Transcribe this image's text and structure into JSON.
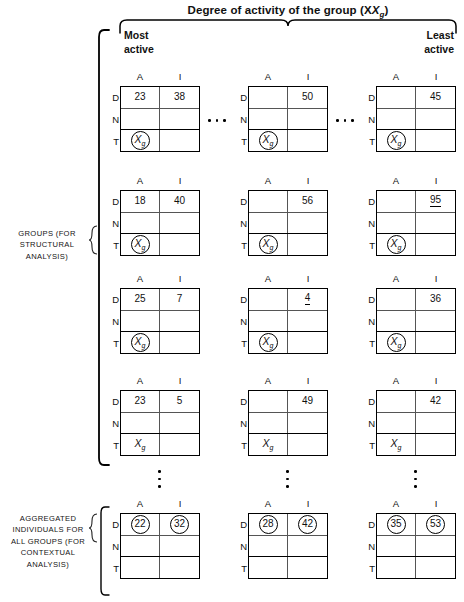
{
  "figure": {
    "title_main": "Degree of activity of the group",
    "title_var": "(X",
    "title_sub": "g",
    "title_close": ")",
    "corner_labels": {
      "most_active": "Most\nactive",
      "least_active": "Least\nactive"
    },
    "side_labels": {
      "groups": "GROUPS (FOR STRUCTURAL ANALYSIS)",
      "aggregated": "AGGREGATED INDIVIDUALS FOR ALL GROUPS (FOR CONTEXTUAL ANALYSIS)"
    },
    "column_headers": [
      "A",
      "I"
    ],
    "row_headers": [
      "D",
      "N",
      "T"
    ],
    "xg_symbol": "X",
    "xg_subscript": "g"
  },
  "chart_data": {
    "type": "table",
    "xlabel": "Degree of activity of the group (Xg) — Most active to Least active",
    "ylabel": "Groups (for structural analysis) / Aggregated individuals for all groups (for contextual analysis)",
    "columns": [
      "A",
      "I"
    ],
    "rows": [
      "D",
      "N",
      "T"
    ],
    "matrix_grid": [
      {
        "band": "groups",
        "row_index": 0,
        "matrices": [
          {
            "col": 0,
            "cells": {
              "D_A": "23",
              "D_I": "38",
              "N_A": "",
              "N_I": "",
              "T_A": "Xg",
              "T_I": ""
            },
            "t_a_circled": true,
            "underlined": []
          },
          {
            "col": 1,
            "cells": {
              "D_A": "",
              "D_I": "50",
              "N_A": "",
              "N_I": "",
              "T_A": "Xg",
              "T_I": ""
            },
            "t_a_circled": true,
            "underlined": []
          },
          {
            "col": 2,
            "cells": {
              "D_A": "",
              "D_I": "45",
              "N_A": "",
              "N_I": "",
              "T_A": "Xg",
              "T_I": ""
            },
            "t_a_circled": true,
            "underlined": []
          }
        ]
      },
      {
        "band": "groups",
        "row_index": 1,
        "matrices": [
          {
            "col": 0,
            "cells": {
              "D_A": "18",
              "D_I": "40",
              "N_A": "",
              "N_I": "",
              "T_A": "Xg",
              "T_I": ""
            },
            "t_a_circled": true,
            "underlined": []
          },
          {
            "col": 1,
            "cells": {
              "D_A": "",
              "D_I": "56",
              "N_A": "",
              "N_I": "",
              "T_A": "Xg",
              "T_I": ""
            },
            "t_a_circled": true,
            "underlined": []
          },
          {
            "col": 2,
            "cells": {
              "D_A": "",
              "D_I": "95",
              "N_A": "",
              "N_I": "",
              "T_A": "Xg",
              "T_I": ""
            },
            "t_a_circled": true,
            "underlined": [
              "D_I"
            ]
          }
        ]
      },
      {
        "band": "groups",
        "row_index": 2,
        "matrices": [
          {
            "col": 0,
            "cells": {
              "D_A": "25",
              "D_I": "7",
              "N_A": "",
              "N_I": "",
              "T_A": "Xg",
              "T_I": ""
            },
            "t_a_circled": true,
            "underlined": []
          },
          {
            "col": 1,
            "cells": {
              "D_A": "",
              "D_I": "4",
              "N_A": "",
              "N_I": "",
              "T_A": "Xg",
              "T_I": ""
            },
            "t_a_circled": true,
            "underlined": [
              "D_I"
            ]
          },
          {
            "col": 2,
            "cells": {
              "D_A": "",
              "D_I": "36",
              "N_A": "",
              "N_I": "",
              "T_A": "Xg",
              "T_I": ""
            },
            "t_a_circled": true,
            "underlined": []
          }
        ]
      },
      {
        "band": "groups",
        "row_index": 3,
        "matrices": [
          {
            "col": 0,
            "cells": {
              "D_A": "23",
              "D_I": "5",
              "N_A": "",
              "N_I": "",
              "T_A": "Xg",
              "T_I": ""
            },
            "t_a_circled": false,
            "underlined": []
          },
          {
            "col": 1,
            "cells": {
              "D_A": "",
              "D_I": "49",
              "N_A": "",
              "N_I": "",
              "T_A": "Xg",
              "T_I": ""
            },
            "t_a_circled": false,
            "underlined": []
          },
          {
            "col": 2,
            "cells": {
              "D_A": "",
              "D_I": "42",
              "N_A": "",
              "N_I": "",
              "T_A": "Xg",
              "T_I": ""
            },
            "t_a_circled": false,
            "underlined": []
          }
        ]
      },
      {
        "band": "aggregated",
        "row_index": 4,
        "matrices": [
          {
            "col": 0,
            "cells": {
              "D_A": "22",
              "D_I": "32",
              "N_A": "",
              "N_I": "",
              "T_A": "",
              "T_I": ""
            },
            "d_circled": true,
            "underlined": []
          },
          {
            "col": 1,
            "cells": {
              "D_A": "28",
              "D_I": "42",
              "N_A": "",
              "N_I": "",
              "T_A": "",
              "T_I": ""
            },
            "d_circled": true,
            "underlined": []
          },
          {
            "col": 2,
            "cells": {
              "D_A": "35",
              "D_I": "53",
              "N_A": "",
              "N_I": "",
              "T_A": "",
              "T_I": ""
            },
            "d_circled": true,
            "underlined": []
          }
        ]
      }
    ]
  }
}
